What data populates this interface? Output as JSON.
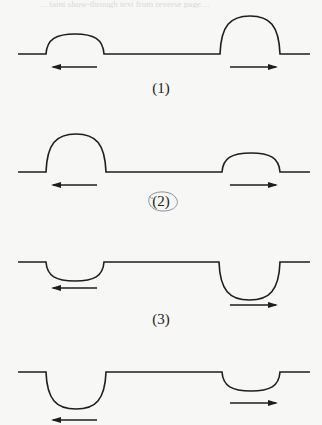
{
  "bleed_text": "…faint show-through text from reverse page…",
  "stroke_color": "#1e1e1e",
  "annotation_color": "#8a8fa0",
  "panels": [
    {
      "label": "(1)",
      "baseline_y": 54,
      "pulses": [
        {
          "x0": 46,
          "x1": 104,
          "extreme_y": 34,
          "direction": "left",
          "arrow_y": 67,
          "arrow_x0": 53,
          "arrow_x1": 97
        },
        {
          "x0": 220,
          "x1": 280,
          "extreme_y": 16,
          "direction": "right",
          "arrow_y": 67,
          "arrow_x0": 230,
          "arrow_x1": 276
        }
      ],
      "label_y": 80
    },
    {
      "label": "(2)",
      "baseline_y": 172,
      "circled": true,
      "pulses": [
        {
          "x0": 46,
          "x1": 106,
          "extreme_y": 134,
          "direction": "left",
          "arrow_y": 185,
          "arrow_x0": 53,
          "arrow_x1": 97
        },
        {
          "x0": 222,
          "x1": 280,
          "extreme_y": 153,
          "direction": "right",
          "arrow_y": 185,
          "arrow_x0": 230,
          "arrow_x1": 276
        }
      ],
      "label_y": 193
    },
    {
      "label": "(3)",
      "baseline_y": 262,
      "pulses": [
        {
          "x0": 46,
          "x1": 104,
          "extreme_y": 281,
          "direction": "left",
          "arrow_y": 288,
          "arrow_x0": 53,
          "arrow_x1": 97
        },
        {
          "x0": 219,
          "x1": 280,
          "extreme_y": 300,
          "direction": "right",
          "arrow_y": 305,
          "arrow_x0": 230,
          "arrow_x1": 276
        }
      ],
      "label_y": 311
    },
    {
      "label": "",
      "baseline_y": 372,
      "pulses": [
        {
          "x0": 46,
          "x1": 106,
          "extreme_y": 409,
          "direction": "left",
          "arrow_y": 420,
          "arrow_x0": 53,
          "arrow_x1": 97
        },
        {
          "x0": 222,
          "x1": 280,
          "extreme_y": 391,
          "direction": "right",
          "arrow_y": 403,
          "arrow_x0": 230,
          "arrow_x1": 276
        }
      ]
    }
  ],
  "baseline_x0": 18,
  "baseline_x1": 310
}
